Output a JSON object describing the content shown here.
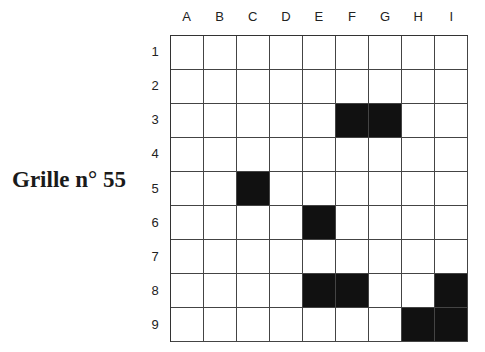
{
  "title": "Grille n° 55",
  "grid": {
    "columns": [
      "A",
      "B",
      "C",
      "D",
      "E",
      "F",
      "G",
      "H",
      "I"
    ],
    "rows": [
      "1",
      "2",
      "3",
      "4",
      "5",
      "6",
      "7",
      "8",
      "9"
    ],
    "filled_cells": [
      "F3",
      "G3",
      "C5",
      "E6",
      "E8",
      "F8",
      "I8",
      "H9",
      "I9"
    ],
    "cell_colors": {
      "empty": "#ffffff",
      "filled": "#111111"
    }
  }
}
